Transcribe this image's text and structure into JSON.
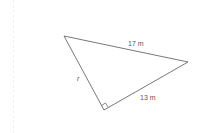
{
  "diagram": {
    "type": "right-triangle",
    "vertices": {
      "top_left": [
        64,
        36
      ],
      "right": [
        188,
        62
      ],
      "right_angle": [
        104,
        110
      ]
    },
    "labels": {
      "hypotenuse": "17 m",
      "leg_bottom": "13 m",
      "leg_left": "r"
    },
    "colors": {
      "stroke": "#555555",
      "text": "#555555"
    }
  }
}
